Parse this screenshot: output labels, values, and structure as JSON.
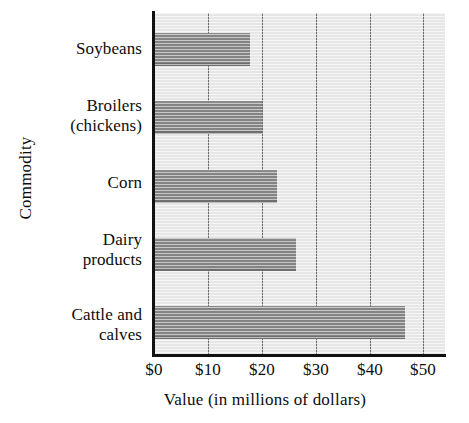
{
  "chart_data": {
    "type": "bar",
    "orientation": "horizontal",
    "title": "",
    "xlabel": "Value (in millions of dollars)",
    "ylabel": "Commodity",
    "categories": [
      "Cattle and calves",
      "Dairy products",
      "Corn",
      "Broilers (chickens)",
      "Soybeans"
    ],
    "category_lines": [
      [
        "Cattle and",
        "calves"
      ],
      [
        "Dairy",
        "products"
      ],
      [
        "Corn"
      ],
      [
        "Broilers",
        "(chickens)"
      ],
      [
        "Soybeans"
      ]
    ],
    "values": [
      46.5,
      26.3,
      22.8,
      20.0,
      17.8
    ],
    "xlim": [
      0,
      54
    ],
    "xticks": [
      0,
      10,
      20,
      30,
      40,
      50
    ],
    "xtick_labels": [
      "$0",
      "$10",
      "$20",
      "$30",
      "$40",
      "$50"
    ],
    "grid": "vertical",
    "legend": "none",
    "colors": {
      "bar_fill": "#858585",
      "plot_background": "#e9e9e9",
      "gridline": "#6e6e6e",
      "axis_line": "#111111",
      "text": "#0d0d0d"
    }
  }
}
